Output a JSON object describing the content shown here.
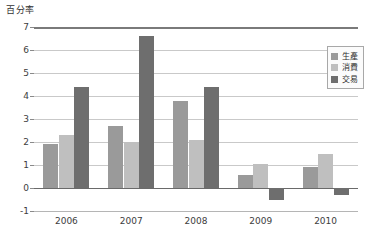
{
  "chart_data": {
    "type": "bar",
    "title": "",
    "ylabel": "百分率",
    "xlabel": "",
    "categories": [
      "2006",
      "2007",
      "2008",
      "2009",
      "2010"
    ],
    "series": [
      {
        "name": "生產",
        "color": "#9a9a9a",
        "values": [
          1.9,
          2.7,
          3.8,
          0.55,
          0.9
        ]
      },
      {
        "name": "消費",
        "color": "#bfbfbf",
        "values": [
          2.3,
          2.0,
          2.1,
          1.05,
          1.5
        ]
      },
      {
        "name": "交易",
        "color": "#6e6e6e",
        "values": [
          4.4,
          6.6,
          4.4,
          -0.5,
          -0.3
        ]
      }
    ],
    "ylim": [
      -1,
      7
    ],
    "yticks": [
      7,
      6,
      5,
      4,
      3,
      2,
      1,
      0,
      -1
    ],
    "ytick_labels": [
      "7",
      "6",
      "5",
      "4",
      "3",
      "2",
      "1",
      "0",
      "-1"
    ],
    "grid": true,
    "legend_position": "right-top"
  },
  "legend": {
    "items": [
      {
        "label": "生產"
      },
      {
        "label": "消費"
      },
      {
        "label": "交易"
      }
    ]
  }
}
